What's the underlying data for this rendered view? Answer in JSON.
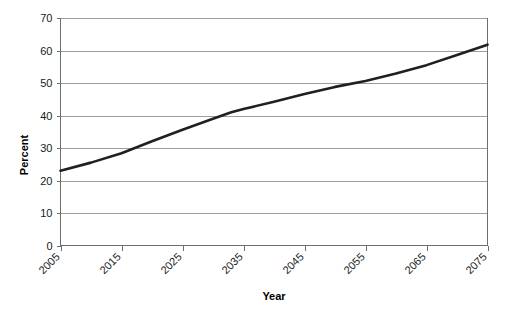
{
  "chart_data": {
    "type": "line",
    "title": "",
    "xlabel": "Year",
    "ylabel": "Percent",
    "x": [
      2005,
      2015,
      2025,
      2035,
      2045,
      2055,
      2065,
      2075
    ],
    "xlim": [
      2005,
      2075
    ],
    "ylim": [
      0,
      70
    ],
    "ytick_values": [
      0,
      10,
      20,
      30,
      40,
      50,
      60,
      70
    ],
    "ytick_labels": [
      "0",
      "10",
      "20",
      "30",
      "40",
      "50",
      "60",
      "70"
    ],
    "xtick_values": [
      2005,
      2015,
      2025,
      2035,
      2045,
      2055,
      2065,
      2075
    ],
    "xtick_labels": [
      "2005",
      "2015",
      "2025",
      "2035",
      "2045",
      "2055",
      "2065",
      "2075"
    ],
    "series": [
      {
        "name": "Percent",
        "color": "#231f20",
        "points": [
          {
            "x": 2005,
            "y": 23.0
          },
          {
            "x": 2010,
            "y": 25.5
          },
          {
            "x": 2015,
            "y": 28.4
          },
          {
            "x": 2020,
            "y": 32.1
          },
          {
            "x": 2025,
            "y": 35.6
          },
          {
            "x": 2030,
            "y": 39.0
          },
          {
            "x": 2033,
            "y": 41.0
          },
          {
            "x": 2035,
            "y": 42.0
          },
          {
            "x": 2040,
            "y": 44.2
          },
          {
            "x": 2045,
            "y": 46.6
          },
          {
            "x": 2050,
            "y": 48.8
          },
          {
            "x": 2055,
            "y": 50.6
          },
          {
            "x": 2060,
            "y": 52.9
          },
          {
            "x": 2065,
            "y": 55.5
          },
          {
            "x": 2070,
            "y": 58.6
          },
          {
            "x": 2075,
            "y": 61.8
          }
        ],
        "values": [
          23.0,
          28.4,
          35.6,
          42.0,
          46.6,
          50.6,
          55.5,
          61.8
        ]
      }
    ],
    "grid": "horizontal",
    "legend": "none",
    "xtick_label_rotation": -45,
    "colors": {
      "line": "#231f20",
      "gridline": "#9d9d9d",
      "axis": "#6e6e6e",
      "text": "#1a1a1a",
      "background": "#ffffff"
    }
  }
}
